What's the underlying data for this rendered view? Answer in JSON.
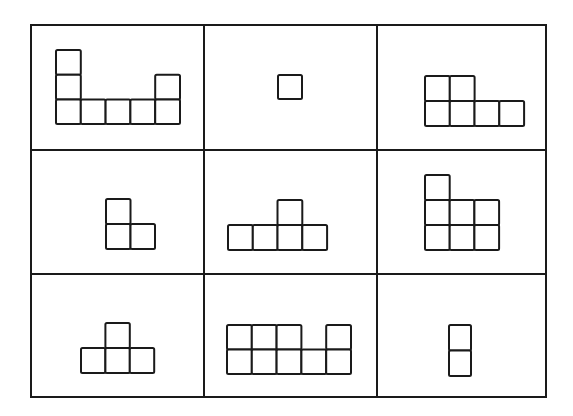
{
  "puzzle": {
    "grid": {
      "rows": 3,
      "cols": 3,
      "left": 31,
      "top": 25,
      "right": 546,
      "bottom": 397,
      "col_dividers": [
        204,
        377
      ],
      "row_dividers": [
        150,
        274
      ],
      "line_color": "#1a1a1a",
      "background": "#ffffff"
    },
    "cells": [
      {
        "id": "r0c0",
        "description": "L/U-shaped figure: tall column of 3 on left, bottom row of 5, column of 2 on right",
        "origin": [
          56,
          50
        ],
        "unit": [
          24.8,
          24.7
        ],
        "squares": [
          [
            0,
            0
          ],
          [
            0,
            1
          ],
          [
            0,
            2
          ],
          [
            1,
            2
          ],
          [
            2,
            2
          ],
          [
            3,
            2
          ],
          [
            4,
            1
          ],
          [
            4,
            2
          ]
        ]
      },
      {
        "id": "r0c1",
        "description": "single square",
        "origin": [
          278,
          75
        ],
        "unit": [
          24,
          24
        ],
        "squares": [
          [
            0,
            0
          ]
        ]
      },
      {
        "id": "r0c2",
        "description": "two squares on top-left over a row of four",
        "origin": [
          425,
          76
        ],
        "unit": [
          24.75,
          25
        ],
        "squares": [
          [
            0,
            0
          ],
          [
            1,
            0
          ],
          [
            0,
            1
          ],
          [
            1,
            1
          ],
          [
            2,
            1
          ],
          [
            3,
            1
          ]
        ]
      },
      {
        "id": "r1c0",
        "description": "L-shape: one square on top-left over a row of two",
        "origin": [
          106,
          199
        ],
        "unit": [
          24.5,
          25
        ],
        "squares": [
          [
            0,
            0
          ],
          [
            0,
            1
          ],
          [
            1,
            1
          ]
        ]
      },
      {
        "id": "r1c1",
        "description": "one square on top (third position) over a row of four",
        "origin": [
          228,
          200
        ],
        "unit": [
          24.75,
          25
        ],
        "squares": [
          [
            2,
            0
          ],
          [
            0,
            1
          ],
          [
            1,
            1
          ],
          [
            2,
            1
          ],
          [
            3,
            1
          ]
        ]
      },
      {
        "id": "r1c2",
        "description": "one square on top-left over a 3x2 block",
        "origin": [
          425,
          175
        ],
        "unit": [
          24.7,
          25
        ],
        "squares": [
          [
            0,
            0
          ],
          [
            0,
            1
          ],
          [
            1,
            1
          ],
          [
            2,
            1
          ],
          [
            0,
            2
          ],
          [
            1,
            2
          ],
          [
            2,
            2
          ]
        ]
      },
      {
        "id": "r2c0",
        "description": "T-shape: one square on top-middle over a row of three",
        "origin": [
          81,
          323
        ],
        "unit": [
          24.4,
          25
        ],
        "squares": [
          [
            1,
            0
          ],
          [
            0,
            1
          ],
          [
            1,
            1
          ],
          [
            2,
            1
          ]
        ]
      },
      {
        "id": "r2c1",
        "description": "2x5 block with the fourth top square missing",
        "origin": [
          227,
          325
        ],
        "unit": [
          24.8,
          24.5
        ],
        "squares": [
          [
            0,
            0
          ],
          [
            1,
            0
          ],
          [
            2,
            0
          ],
          [
            4,
            0
          ],
          [
            0,
            1
          ],
          [
            1,
            1
          ],
          [
            2,
            1
          ],
          [
            3,
            1
          ],
          [
            4,
            1
          ]
        ]
      },
      {
        "id": "r2c2",
        "description": "vertical domino of two squares",
        "origin": [
          449,
          325
        ],
        "unit": [
          22,
          25.5
        ],
        "squares": [
          [
            0,
            0
          ],
          [
            0,
            1
          ]
        ]
      }
    ]
  }
}
